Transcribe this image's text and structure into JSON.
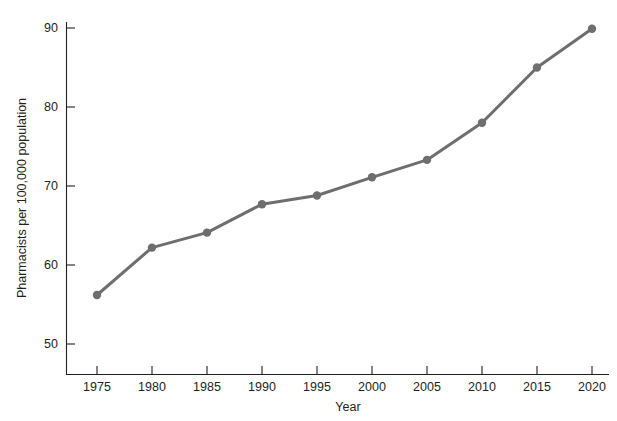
{
  "chart_data": {
    "type": "line",
    "title": "",
    "subtitle": "",
    "xlabel": "Year",
    "ylabel": "Pharmacists per 100,000 population",
    "x": [
      1975,
      1980,
      1985,
      1990,
      1995,
      2000,
      2005,
      2010,
      2015,
      2020
    ],
    "xtick_labels": [
      "1975",
      "1980",
      "1985",
      "1990",
      "1995",
      "2000",
      "2005",
      "2010",
      "2015",
      "2020"
    ],
    "ytick_labels": [
      "50",
      "60",
      "70",
      "80",
      "90"
    ],
    "yticks": [
      50,
      60,
      70,
      80,
      90
    ],
    "xlim": [
      1972.5,
      2021.5
    ],
    "ylim": [
      46,
      90
    ],
    "grid": false,
    "legend": false,
    "series": [
      {
        "name": "Pharmacists per 100,000 population",
        "color": "#6e6e6e",
        "marker": "circle",
        "values": [
          56.2,
          62.2,
          64.1,
          67.7,
          68.8,
          71.1,
          73.3,
          78.0,
          85.0,
          89.9
        ]
      }
    ]
  },
  "axes": {
    "x_title": "Year",
    "y_title": "Pharmacists per 100,000 population",
    "x_ticks": [
      "1975",
      "1980",
      "1985",
      "1990",
      "1995",
      "2000",
      "2005",
      "2010",
      "2015",
      "2020"
    ],
    "y_ticks": [
      "50",
      "60",
      "70",
      "80",
      "90"
    ]
  },
  "colors": {
    "line": "#6e6e6e",
    "axis": "#231f20",
    "background": "#ffffff"
  }
}
